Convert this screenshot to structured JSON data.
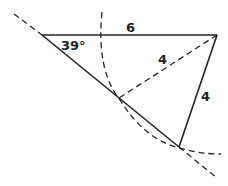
{
  "diagram": {
    "type": "geometry-ambiguous-case-triangle",
    "labels": {
      "angle": "39°",
      "top_side": "6",
      "dashed_side": "4",
      "right_side": "4"
    },
    "colors": {
      "stroke": "#222222",
      "background": "#ffffff"
    }
  }
}
